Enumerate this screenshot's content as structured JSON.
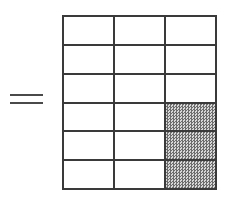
{
  "figure": {
    "equals_symbol": "="
  },
  "grid": {
    "columns": 3,
    "rows": 6,
    "total_cells": 18,
    "shaded_cells": 3,
    "shading_label": "shaded",
    "empty_label": "unshaded",
    "line_color": "#3a3a3a",
    "cell_fill_color": "#ffffff",
    "shade_color": "#6d6d6d",
    "cells": [
      {
        "row": 1,
        "col": 1,
        "shaded": false
      },
      {
        "row": 1,
        "col": 2,
        "shaded": false
      },
      {
        "row": 1,
        "col": 3,
        "shaded": false
      },
      {
        "row": 2,
        "col": 1,
        "shaded": false
      },
      {
        "row": 2,
        "col": 2,
        "shaded": false
      },
      {
        "row": 2,
        "col": 3,
        "shaded": false
      },
      {
        "row": 3,
        "col": 1,
        "shaded": false
      },
      {
        "row": 3,
        "col": 2,
        "shaded": false
      },
      {
        "row": 3,
        "col": 3,
        "shaded": false
      },
      {
        "row": 4,
        "col": 1,
        "shaded": false
      },
      {
        "row": 4,
        "col": 2,
        "shaded": false
      },
      {
        "row": 4,
        "col": 3,
        "shaded": true
      },
      {
        "row": 5,
        "col": 1,
        "shaded": false
      },
      {
        "row": 5,
        "col": 2,
        "shaded": false
      },
      {
        "row": 5,
        "col": 3,
        "shaded": true
      },
      {
        "row": 6,
        "col": 1,
        "shaded": false
      },
      {
        "row": 6,
        "col": 2,
        "shaded": false
      },
      {
        "row": 6,
        "col": 3,
        "shaded": true
      }
    ]
  }
}
